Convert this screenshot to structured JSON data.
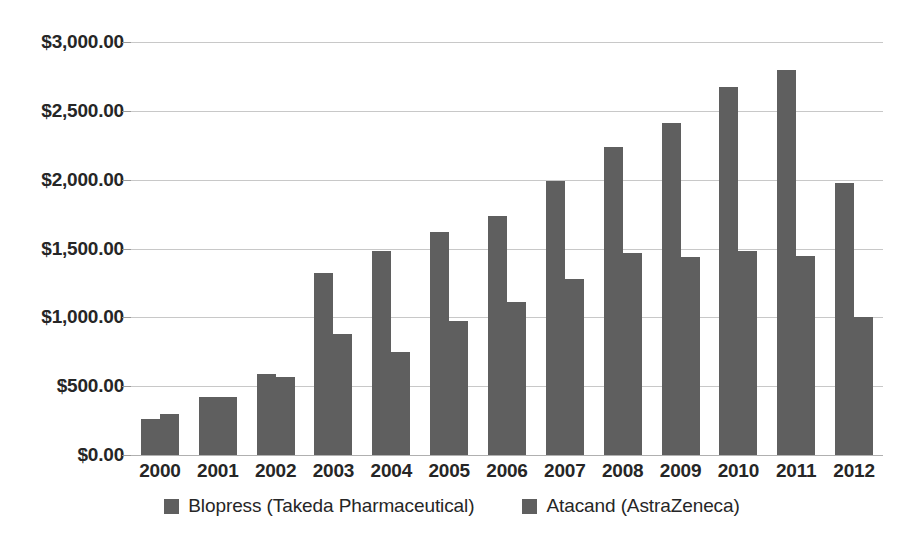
{
  "chart_data": {
    "type": "bar",
    "title": "",
    "subtitle": "",
    "xlabel": "",
    "ylabel": "",
    "categories": [
      "2000",
      "2001",
      "2002",
      "2003",
      "2004",
      "2005",
      "2006",
      "2007",
      "2008",
      "2009",
      "2010",
      "2011",
      "2012"
    ],
    "series": [
      {
        "name": "Blopress (Takeda Pharmaceutical)",
        "color": "#5f5f5f",
        "values": [
          265,
          420,
          590,
          1325,
          1485,
          1620,
          1735,
          1990,
          2240,
          2410,
          2670,
          2800,
          1975
        ]
      },
      {
        "name": "Atacand (AstraZeneca)",
        "color": "#5f5f5f",
        "values": [
          295,
          420,
          565,
          880,
          750,
          970,
          1110,
          1280,
          1470,
          1435,
          1485,
          1445,
          1000
        ]
      }
    ],
    "ylim": [
      0,
      3000
    ],
    "ytick_values": [
      0,
      500,
      1000,
      1500,
      2000,
      2500,
      3000
    ],
    "ytick_labels": [
      "$0.00",
      "$500.00",
      "$1,000.00",
      "$1,500.00",
      "$2,000.00",
      "$2,500.00",
      "$3,000.00"
    ],
    "grid": true,
    "legend_position": "bottom",
    "value_prefix": "$",
    "value_suffix": ""
  },
  "legend": {
    "items": [
      {
        "label": "Blopress (Takeda Pharmaceutical)",
        "swatch_name": "legend-swatch-blopress"
      },
      {
        "label": "Atacand (AstraZeneca)",
        "swatch_name": "legend-swatch-atacand"
      }
    ]
  }
}
